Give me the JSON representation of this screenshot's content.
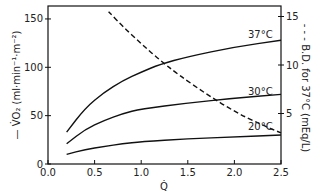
{
  "chart_data": {
    "type": "line",
    "title": "",
    "xlabel": "Q̇",
    "ylabel": "— V̇O2 (ml·min⁻¹·m⁻²)",
    "ylabel_right": "- - - B.D. for 37°C (mEq/L)",
    "xlim": [
      0.0,
      2.5
    ],
    "ylim": [
      0,
      160
    ],
    "ylim_right": [
      0,
      16.5
    ],
    "x_ticks": [
      "0.0",
      "0.5",
      "1.0",
      "1.5",
      "2.0",
      "2.5"
    ],
    "y_ticks": [
      "0",
      "50",
      "100",
      "150"
    ],
    "y_ticks_right": [
      "5",
      "10",
      "15"
    ],
    "grid": false,
    "series": [
      {
        "name": "37°C",
        "axis": "left",
        "style": "solid",
        "x": [
          0.2,
          0.4,
          0.6,
          0.8,
          1.0,
          1.2,
          1.5,
          2.0,
          2.5
        ],
        "y": [
          33,
          58,
          74,
          86,
          95,
          103,
          111,
          121,
          128
        ]
      },
      {
        "name": "30°C",
        "axis": "left",
        "style": "solid",
        "x": [
          0.2,
          0.4,
          0.6,
          0.8,
          1.0,
          1.5,
          2.0,
          2.5
        ],
        "y": [
          21,
          36,
          45,
          52,
          57,
          63,
          68,
          72
        ]
      },
      {
        "name": "20°C",
        "axis": "left",
        "style": "solid",
        "x": [
          0.2,
          0.4,
          0.6,
          0.8,
          1.0,
          1.5,
          2.0,
          2.5
        ],
        "y": [
          10,
          15,
          18,
          21,
          23,
          26,
          28,
          30
        ]
      },
      {
        "name": "B.D. for 37°C",
        "axis": "right",
        "style": "dashed",
        "x": [
          0.65,
          0.8,
          1.0,
          1.2,
          1.4,
          1.7,
          2.0,
          2.3,
          2.5
        ],
        "y": [
          15.5,
          14.0,
          12.2,
          10.5,
          9.0,
          7.0,
          5.2,
          3.8,
          3.0
        ]
      }
    ],
    "annotations": [
      "37°C",
      "30°C",
      "20°C"
    ]
  },
  "labels": {
    "l37": "37°C",
    "l30": "30°C",
    "l20": "20°C",
    "ylabel": "— V̇O₂ (ml·min⁻¹·m⁻²)",
    "ylabel_right": "- - - B.D. for 37°C (mEq/L)",
    "xlabel": "Q̇"
  }
}
